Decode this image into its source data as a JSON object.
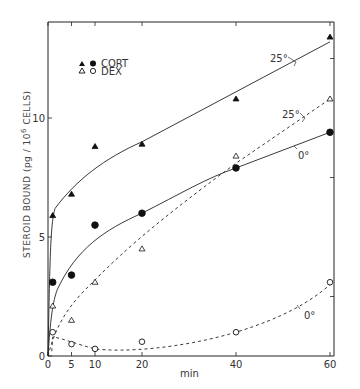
{
  "chart_data": {
    "type": "scatter",
    "title": "",
    "xlabel": "min",
    "ylabel": "STEROID BOUND (pg / 10^6 CELLS)",
    "ylabel_parts": {
      "main": "STEROID  BOUND (pg / 10",
      "sup": "6",
      "end": " CELLS)"
    },
    "xlim": [
      0,
      60
    ],
    "ylim": [
      0,
      14
    ],
    "xticks": [
      0,
      5,
      10,
      20,
      40,
      60
    ],
    "yticks": [
      0,
      5,
      10
    ],
    "grid": false,
    "legend": {
      "position": "upper left",
      "entries": [
        {
          "symbols": [
            "filled-triangle",
            "filled-circle"
          ],
          "label": "CORT"
        },
        {
          "symbols": [
            "open-triangle",
            "open-circle"
          ],
          "label": "DEX"
        }
      ]
    },
    "series": [
      {
        "name": "CORT 25°",
        "marker": "filled-triangle",
        "line": "solid",
        "x": [
          1,
          5,
          10,
          20,
          40,
          60
        ],
        "y": [
          5.9,
          6.8,
          8.8,
          8.9,
          10.8,
          13.4
        ]
      },
      {
        "name": "CORT 0°",
        "marker": "filled-circle",
        "line": "solid",
        "x": [
          1,
          5,
          10,
          20,
          40,
          60
        ],
        "y": [
          3.1,
          3.4,
          5.5,
          6.0,
          7.9,
          9.4
        ]
      },
      {
        "name": "DEX 25°",
        "marker": "open-triangle",
        "line": "dashed",
        "x": [
          1,
          5,
          10,
          20,
          40,
          60
        ],
        "y": [
          2.1,
          1.5,
          3.1,
          4.5,
          8.4,
          10.8
        ]
      },
      {
        "name": "DEX 0°",
        "marker": "open-circle",
        "line": "dashed",
        "x": [
          1,
          5,
          10,
          20,
          40,
          60
        ],
        "y": [
          1.0,
          0.5,
          0.3,
          0.6,
          1.0,
          3.1
        ]
      }
    ],
    "annotations": [
      {
        "text": "25°",
        "near_series": "CORT 25°"
      },
      {
        "text": "25°",
        "near_series": "DEX 25°"
      },
      {
        "text": "0°",
        "near_series": "CORT 0°"
      },
      {
        "text": "0°",
        "near_series": "DEX 0°"
      }
    ]
  }
}
